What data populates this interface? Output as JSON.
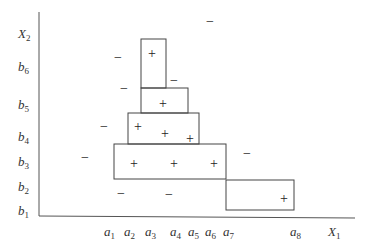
{
  "axes": {
    "x_label": {
      "base": "X",
      "sub": "1",
      "x": 328,
      "y": 236
    },
    "y_label": {
      "base": "X",
      "sub": "2",
      "x": 18,
      "y": 38
    },
    "x_ticks": [
      {
        "base": "a",
        "sub": "1",
        "x": 104
      },
      {
        "base": "a",
        "sub": "2",
        "x": 124
      },
      {
        "base": "a",
        "sub": "3",
        "x": 145
      },
      {
        "base": "a",
        "sub": "4",
        "x": 170
      },
      {
        "base": "a",
        "sub": "5",
        "x": 188
      },
      {
        "base": "a",
        "sub": "6",
        "x": 205
      },
      {
        "base": "a",
        "sub": "7",
        "x": 223
      },
      {
        "base": "a",
        "sub": "8",
        "x": 290
      }
    ],
    "y_ticks": [
      {
        "base": "b",
        "sub": "6",
        "y": 71
      },
      {
        "base": "b",
        "sub": "5",
        "y": 109
      },
      {
        "base": "b",
        "sub": "4",
        "y": 141
      },
      {
        "base": "b",
        "sub": "3",
        "y": 166
      },
      {
        "base": "b",
        "sub": "2",
        "y": 191
      },
      {
        "base": "b",
        "sub": "1",
        "y": 215
      }
    ]
  },
  "boxes": [
    {
      "x": 141,
      "y": 39,
      "w": 25,
      "h": 49
    },
    {
      "x": 141,
      "y": 88,
      "w": 47,
      "h": 25
    },
    {
      "x": 128,
      "y": 113,
      "w": 71,
      "h": 31
    },
    {
      "x": 114,
      "y": 144,
      "w": 112,
      "h": 35
    },
    {
      "x": 226,
      "y": 180,
      "w": 68,
      "h": 30
    }
  ],
  "plus_points": [
    {
      "x": 152,
      "y": 53
    },
    {
      "x": 163,
      "y": 103
    },
    {
      "x": 138,
      "y": 126
    },
    {
      "x": 165,
      "y": 133
    },
    {
      "x": 190,
      "y": 138
    },
    {
      "x": 134,
      "y": 163
    },
    {
      "x": 174,
      "y": 163
    },
    {
      "x": 214,
      "y": 163
    },
    {
      "x": 284,
      "y": 198
    }
  ],
  "minus_points": [
    {
      "x": 210,
      "y": 21
    },
    {
      "x": 118,
      "y": 57
    },
    {
      "x": 174,
      "y": 80
    },
    {
      "x": 124,
      "y": 88
    },
    {
      "x": 104,
      "y": 126
    },
    {
      "x": 85,
      "y": 157
    },
    {
      "x": 247,
      "y": 153
    },
    {
      "x": 121,
      "y": 193
    },
    {
      "x": 169,
      "y": 194
    }
  ],
  "plus_symbol": "+",
  "minus_symbol": "−"
}
